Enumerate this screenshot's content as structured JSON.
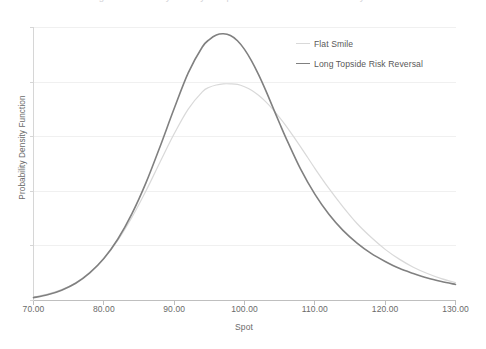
{
  "caption": {
    "clipped_top_text": "Figure: Probability density comparison under different volatility smiles"
  },
  "chart_data": {
    "type": "line",
    "title": "",
    "xlabel": "Spot",
    "ylabel": "Probability Density Function",
    "xlim": [
      70,
      130
    ],
    "ylim": [
      0,
      0.0475
    ],
    "xticks": [
      "70.00",
      "80.00",
      "90.00",
      "100.00",
      "110.00",
      "120.00",
      "130.00"
    ],
    "xtick_values": [
      70,
      80,
      90,
      100,
      110,
      120,
      130
    ],
    "yticks": [],
    "grid": "horizontal",
    "legend_position": "top-right",
    "x": [
      70,
      72,
      74,
      76,
      78,
      80,
      82,
      84,
      86,
      88,
      90,
      92,
      94,
      95,
      96,
      97,
      98,
      99,
      100,
      101,
      102,
      103,
      104,
      105,
      106,
      108,
      110,
      112,
      114,
      116,
      118,
      120,
      122,
      124,
      126,
      128,
      130
    ],
    "series": [
      {
        "name": "Flat Smile",
        "color": "#d9d9d9",
        "width": 1.2,
        "peak_x": 99.5,
        "peak_y": 0.0377,
        "values": [
          0.0006,
          0.0011,
          0.0019,
          0.0031,
          0.0049,
          0.0073,
          0.0105,
          0.0145,
          0.0191,
          0.0241,
          0.029,
          0.0333,
          0.0363,
          0.0371,
          0.0375,
          0.0377,
          0.0377,
          0.0376,
          0.0372,
          0.0366,
          0.0357,
          0.0346,
          0.0333,
          0.0318,
          0.0302,
          0.0267,
          0.023,
          0.0195,
          0.0163,
          0.0134,
          0.011,
          0.0089,
          0.0072,
          0.0058,
          0.0047,
          0.0038,
          0.0031
        ]
      },
      {
        "name": "Long Topside Risk Reversal",
        "color": "#808080",
        "width": 1.6,
        "peak_x": 97.5,
        "peak_y": 0.0464,
        "values": [
          0.0005,
          0.001,
          0.0018,
          0.003,
          0.0048,
          0.0073,
          0.0107,
          0.0151,
          0.0205,
          0.0268,
          0.0334,
          0.0396,
          0.0441,
          0.0454,
          0.0462,
          0.0464,
          0.0461,
          0.0452,
          0.0437,
          0.0417,
          0.0393,
          0.0366,
          0.0337,
          0.0308,
          0.028,
          0.0228,
          0.0185,
          0.015,
          0.0122,
          0.01,
          0.0082,
          0.0068,
          0.0056,
          0.0047,
          0.0039,
          0.0033,
          0.0028
        ]
      }
    ]
  }
}
